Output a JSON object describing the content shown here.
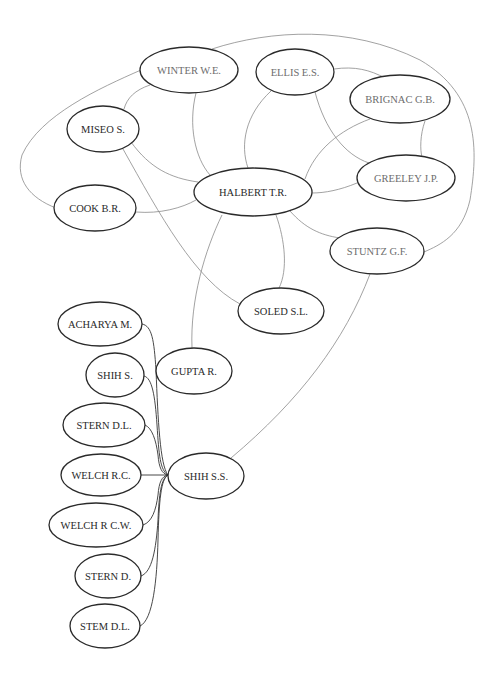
{
  "diagram": {
    "type": "co-authorship network",
    "nodes": [
      {
        "id": "winter",
        "label": "WINTER W.E.",
        "cx": 189,
        "cy": 70,
        "rx": 49,
        "ry": 23,
        "light": true
      },
      {
        "id": "ellis",
        "label": "ELLIS E.S.",
        "cx": 295,
        "cy": 72,
        "rx": 39,
        "ry": 23,
        "light": true
      },
      {
        "id": "brignac",
        "label": "BRIGNAC G.B.",
        "cx": 400,
        "cy": 99,
        "rx": 50,
        "ry": 24,
        "light": true
      },
      {
        "id": "miseo",
        "label": "MISEO S.",
        "cx": 103,
        "cy": 129,
        "rx": 36,
        "ry": 23,
        "light": false
      },
      {
        "id": "greeley",
        "label": "GREELEY J.P.",
        "cx": 406,
        "cy": 178,
        "rx": 49,
        "ry": 23,
        "light": true
      },
      {
        "id": "halbert",
        "label": "HALBERT T.R.",
        "cx": 253,
        "cy": 192,
        "rx": 59,
        "ry": 24,
        "light": false
      },
      {
        "id": "cook",
        "label": "COOK B.R.",
        "cx": 95,
        "cy": 208,
        "rx": 41,
        "ry": 23,
        "light": false
      },
      {
        "id": "stuntz",
        "label": "STUNTZ G.F.",
        "cx": 377,
        "cy": 251,
        "rx": 47,
        "ry": 23,
        "light": true
      },
      {
        "id": "soled",
        "label": "SOLED S.L.",
        "cx": 281,
        "cy": 311,
        "rx": 43,
        "ry": 23,
        "light": false
      },
      {
        "id": "acharya",
        "label": "ACHARYA M.",
        "cx": 100,
        "cy": 324,
        "rx": 42,
        "ry": 22,
        "light": false
      },
      {
        "id": "shih_s",
        "label": "SHIH S.",
        "cx": 115,
        "cy": 375,
        "rx": 29,
        "ry": 22,
        "light": false
      },
      {
        "id": "gupta",
        "label": "GUPTA R.",
        "cx": 194,
        "cy": 371,
        "rx": 38,
        "ry": 23,
        "light": false
      },
      {
        "id": "stern_dl",
        "label": "STERN D.L.",
        "cx": 104,
        "cy": 425,
        "rx": 41,
        "ry": 22,
        "light": false
      },
      {
        "id": "welch_rc",
        "label": "WELCH R.C.",
        "cx": 101,
        "cy": 475,
        "rx": 40,
        "ry": 21,
        "light": false
      },
      {
        "id": "shih_ss",
        "label": "SHIH S.S.",
        "cx": 206,
        "cy": 476,
        "rx": 38,
        "ry": 23,
        "light": false
      },
      {
        "id": "welch_rcw",
        "label": "WELCH R C.W.",
        "cx": 96,
        "cy": 525,
        "rx": 47,
        "ry": 22,
        "light": false
      },
      {
        "id": "stern_d",
        "label": "STERN D.",
        "cx": 108,
        "cy": 576,
        "rx": 33,
        "ry": 22,
        "light": false
      },
      {
        "id": "stem_dl",
        "label": "STEM D.L.",
        "cx": 105,
        "cy": 626,
        "rx": 35,
        "ry": 22,
        "light": false
      }
    ],
    "edges": [
      {
        "from": "winter",
        "to": "stuntz",
        "path": "M212,49 C270,30 350,25 420,60 C480,95 478,150 470,200 C462,235 440,245 424,252",
        "dark": false
      },
      {
        "from": "winter",
        "to": "cook",
        "path": "M141,70 C100,88 40,115 22,155 C15,180 30,198 56,208",
        "dark": false
      },
      {
        "from": "winter",
        "to": "miseo",
        "path": "M150,85 C135,90 127,98 124,109",
        "dark": false
      },
      {
        "from": "winter",
        "to": "halbert",
        "path": "M196,93 C188,125 195,158 210,175",
        "dark": false
      },
      {
        "from": "miseo",
        "to": "halbert",
        "path": "M131,142 C150,168 170,178 198,182",
        "dark": false
      },
      {
        "from": "miseo",
        "to": "soled",
        "path": "M123,149 C160,215 195,280 240,304",
        "dark": false
      },
      {
        "from": "cook",
        "to": "halbert",
        "path": "M136,212 C160,214 182,208 196,200",
        "dark": false
      },
      {
        "from": "ellis",
        "to": "halbert",
        "path": "M271,91 C245,115 240,145 248,168",
        "dark": false
      },
      {
        "from": "ellis",
        "to": "greeley",
        "path": "M315,92 C325,130 345,155 369,163",
        "dark": false
      },
      {
        "from": "ellis",
        "to": "brignac",
        "path": "M334,69 C355,66 370,70 385,78",
        "dark": false
      },
      {
        "from": "brignac",
        "to": "halbert",
        "path": "M370,119 C340,130 315,150 305,179",
        "dark": false
      },
      {
        "from": "brignac",
        "to": "greeley",
        "path": "M425,121 C420,135 420,150 422,157",
        "dark": false
      },
      {
        "from": "greeley",
        "to": "halbert",
        "path": "M357,183 C340,190 325,193 312,193",
        "dark": false
      },
      {
        "from": "halbert",
        "to": "stuntz",
        "path": "M290,211 C305,228 320,235 340,238",
        "dark": false
      },
      {
        "from": "halbert",
        "to": "soled",
        "path": "M276,215 C285,240 288,270 279,288",
        "dark": false
      },
      {
        "from": "halbert",
        "to": "gupta",
        "path": "M222,215 C205,250 190,300 192,348",
        "dark": false
      },
      {
        "from": "stuntz",
        "to": "shih_ss",
        "path": "M370,274 C345,340 300,400 231,458",
        "dark": false
      },
      {
        "from": "shih_ss",
        "to": "welch_rc",
        "path": "M168,475 L141,475",
        "dark": true
      },
      {
        "from": "acharya",
        "to": "shih_ss",
        "path": "M142,324 C152,326 154,340 156,370 C158,420 160,465 168,475",
        "dark": true
      },
      {
        "from": "shih_s",
        "to": "shih_ss",
        "path": "M144,376 C152,378 155,395 157,425 C159,455 160,470 168,475",
        "dark": true
      },
      {
        "from": "stern_dl",
        "to": "shih_ss",
        "path": "M145,425 C152,428 156,440 158,455 C159,468 162,474 168,475",
        "dark": true
      },
      {
        "from": "welch_rcw",
        "to": "shih_ss",
        "path": "M143,525 C152,522 156,510 158,495 C159,482 162,476 168,475",
        "dark": true
      },
      {
        "from": "stern_d",
        "to": "shih_ss",
        "path": "M141,576 C152,572 156,550 158,520 C159,495 161,478 168,475",
        "dark": true
      },
      {
        "from": "stem_dl",
        "to": "shih_ss",
        "path": "M140,626 C153,620 157,580 158,540 C159,500 161,479 168,475",
        "dark": true
      }
    ]
  }
}
